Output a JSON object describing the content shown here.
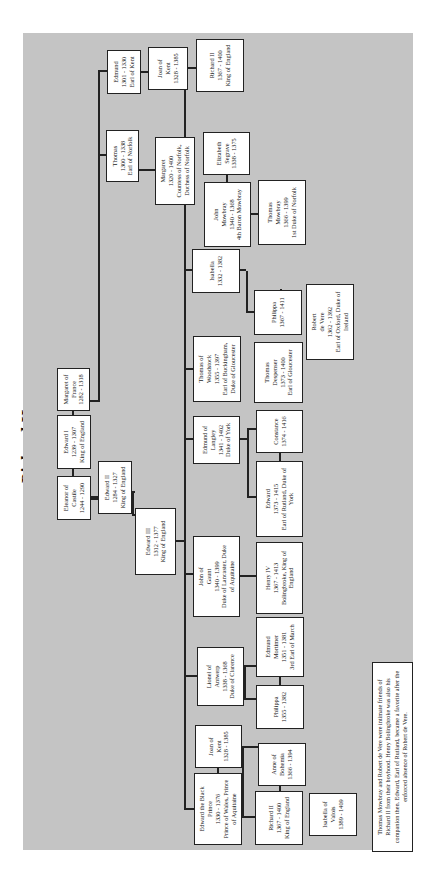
{
  "title": "Richard II",
  "people": {
    "edmund_kent": {
      "name": "Edmund",
      "dates": "1301 - 1330",
      "title": "Earl of Kent"
    },
    "joan_kent_top": {
      "name": "Joan of",
      "name2": "Kent",
      "dates": "1328 - 1385"
    },
    "richard_top": {
      "name": "Richard II",
      "dates": "1367 - 1400",
      "title": "King of England"
    },
    "thomas_norfolk": {
      "name": "Thomas",
      "dates": "1300 - 1338",
      "title": "Earl of Norfolk"
    },
    "margaret_norfolk": {
      "name": "Margaret",
      "dates": "1320 - 1400",
      "title": "Countess of Norfolk,",
      "title2": "Duchess of Norfolk"
    },
    "elizabeth_segrave": {
      "name": "Elizabeth",
      "name2": "Segrave",
      "dates": "1338 - 1375"
    },
    "john_mowbray": {
      "name": "John",
      "name2": "Mowbray",
      "dates": "1340 - 1368",
      "title": "4th Baron Mowbray"
    },
    "thomas_mowbray": {
      "name": "Thomas",
      "name2": "Mowbray",
      "dates": "1366 - 1399",
      "title": "1st Duke of Norfolk"
    },
    "isabella": {
      "name": "Isabella",
      "dates": "1332 - 1382"
    },
    "philippa_coucy": {
      "name": "Philippa",
      "dates": "1367 - 1411"
    },
    "robert_de_vere": {
      "name": "Robert",
      "name2": "de Vere",
      "dates": "1362 - 1392",
      "title": "Earl of Oxford, Duke of",
      "title2": "Ireland"
    },
    "thomas_woodstock": {
      "name": "Thomas of",
      "name2": "Woodstock",
      "dates": "1355 - 1397",
      "title": "Earl of Buckingham,",
      "title2": "Duke of Gloucester"
    },
    "thomas_despenser": {
      "name": "Thomas",
      "name2": "Despenser",
      "dates": "1373 - 1400",
      "title": "Earl of Gloucester"
    },
    "margaret_france": {
      "name": "Margaret of",
      "name2": "France",
      "dates": "1282 - 1318"
    },
    "edward_i": {
      "name": "Edward I",
      "dates": "1239 - 1307",
      "title": "King of England"
    },
    "eleanor_castile": {
      "name": "Eleanor of",
      "name2": "Castile",
      "dates": "1244 - 1290"
    },
    "edward_ii": {
      "name": "Edward II",
      "dates": "1284 - 1327",
      "title": "King of England"
    },
    "edward_iii": {
      "name": "Edward III",
      "dates": "1312 - 1377",
      "title": "King of England"
    },
    "edmund_langley": {
      "name": "Edmund of",
      "name2": "Langley",
      "dates": "1341 - 1402",
      "title": "Duke of York"
    },
    "constance": {
      "name": "Constance",
      "dates": "1374 - 1416"
    },
    "edward_york": {
      "name": "Edward",
      "dates": "1373 - 1415",
      "title": "Earl of Rutland, Duke of",
      "title2": "York"
    },
    "john_gaunt": {
      "name": "John of",
      "name2": "Gaunt",
      "dates": "1340 - 1399",
      "title": "Duke of Lancaster, Duke",
      "title2": "of Aquitaine"
    },
    "henry_iv": {
      "name": "Henry IV",
      "dates": "1367 - 1413",
      "title": "Bolingbroke, King of",
      "title2": "England"
    },
    "edmund_mortimer": {
      "name": "Edmund",
      "name2": "Mortimer",
      "dates": "1351 - 1381",
      "title": "3rd Earl of March"
    },
    "lionel": {
      "name": "Lionel of",
      "name2": "Antwerp",
      "dates": "1338 - 1368",
      "title": "Duke of Clarence"
    },
    "philippa_clarence": {
      "name": "Philippa",
      "dates": "1355 - 1382"
    },
    "joan_kent": {
      "name": "Joan of",
      "name2": "Kent",
      "dates": "1328 - 1385"
    },
    "black_prince": {
      "name": "Edward the Black",
      "name2": "Prince",
      "dates": "1330 - 1376",
      "title": "Prince of Wales, Prince",
      "title2": "of Aquitaine"
    },
    "anne_bohemia": {
      "name": "Anne of",
      "name2": "Bohemia",
      "dates": "1366 - 1394"
    },
    "richard_ii": {
      "name": "Richard II",
      "dates": "1367 - 1400",
      "title": "King of England"
    },
    "isabella_valois": {
      "name": "Isabella of",
      "name2": "Valois",
      "dates": "1389 - 1409"
    }
  },
  "note": "Thomas Mowbray and Robert de Vere were intimate friends of Richard II from their boyhood. Henry Bolingbroke was also his companion then. Edward, Earl of Rutland, became a favorite after the enforced absence of Robert de Vere."
}
